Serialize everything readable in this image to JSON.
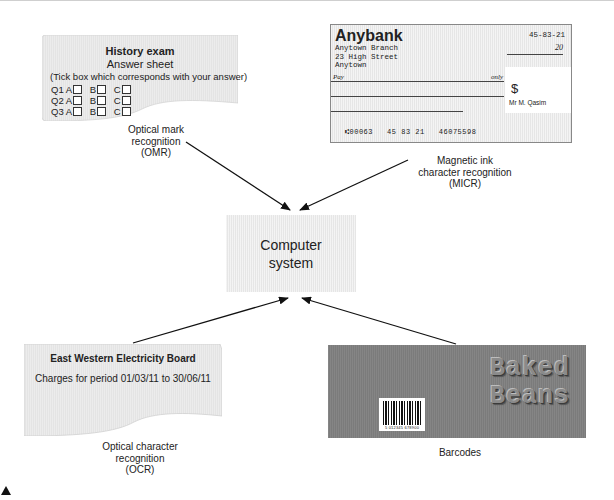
{
  "omr_sheet": {
    "title": "History exam",
    "subtitle": "Answer sheet",
    "instruction": "(Tick box which corresponds with your answer)",
    "questions": [
      {
        "q": "Q1",
        "options": [
          "A",
          "B",
          "C"
        ]
      },
      {
        "q": "Q2",
        "options": [
          "A",
          "B",
          "C"
        ]
      },
      {
        "q": "Q3",
        "options": [
          "A",
          "B",
          "C"
        ]
      }
    ],
    "label": [
      "Optical mark",
      "recognition",
      "(OMR)"
    ]
  },
  "cheque": {
    "bank": "Anybank",
    "address": [
      "Anytown Branch",
      "23 High Street",
      "Anytown"
    ],
    "sort_code": "45-83-21",
    "date_suffix": "20",
    "pay_label": "Pay",
    "only_label": "only",
    "currency_symbol": "$",
    "payee": "Mr M. Qasim",
    "micr_line": "⑆00063   45 83 21   46075598",
    "label": [
      "Magnetic ink",
      "character recognition",
      "(MICR)"
    ]
  },
  "computer": {
    "label_line1": "Computer",
    "label_line2": "system"
  },
  "bill": {
    "title": "East Western Electricity Board",
    "charges": "Charges for period 01/03/11 to 30/06/11",
    "label": [
      "Optical character",
      "recognition",
      "(OCR)"
    ]
  },
  "product": {
    "brand_line1": "Baked",
    "brand_line2": "Beans",
    "barcode_number": "5 012345 678900",
    "label": "Barcodes"
  },
  "colors": {
    "card_fill": "#e6e6e6",
    "product_fill": "#7b7b7b",
    "arrow": "#111111"
  }
}
